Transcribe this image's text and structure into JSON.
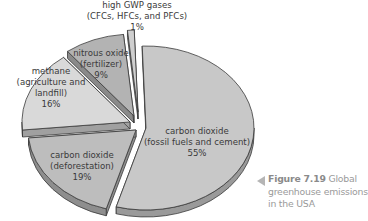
{
  "chart_data": {
    "type": "pie",
    "style": "3d-exploded",
    "title": "Global greenhouse emissions in the USA",
    "slices": [
      {
        "label_lines": [
          "carbon dioxide",
          "(fossil fuels and cement)",
          "55%"
        ],
        "name": "carbon dioxide (fossil fuels and cement)",
        "value": 55,
        "color": "#c8c8c8",
        "side": "#9a9a9a"
      },
      {
        "label_lines": [
          "carbon dioxide",
          "(deforestation)",
          "19%"
        ],
        "name": "carbon dioxide (deforestation)",
        "value": 19,
        "color": "#bdbdbd",
        "side": "#8e8e8e"
      },
      {
        "label_lines": [
          "methane",
          "(agriculture and",
          "landfill)",
          "16%"
        ],
        "name": "methane (agriculture and landfill)",
        "value": 16,
        "color": "#d9d9d9",
        "side": "#a0a0a0"
      },
      {
        "label_lines": [
          "nitrous oxide",
          "(fertilizer)",
          "9%"
        ],
        "name": "nitrous oxide (fertilizer)",
        "value": 9,
        "color": "#b3b3b3",
        "side": "#8a8a8a"
      },
      {
        "label_lines": [
          "high GWP gases",
          "(CFCs, HFCs, and PFCs)",
          "1%"
        ],
        "name": "high GWP gases (CFCs, HFCs, and PFCs)",
        "value": 1,
        "color": "#cfcfcf",
        "side": "#9c9c9c"
      }
    ]
  },
  "caption": {
    "figure_label": "Figure 7.19",
    "text": "Global greenhouse emissions in the USA"
  }
}
